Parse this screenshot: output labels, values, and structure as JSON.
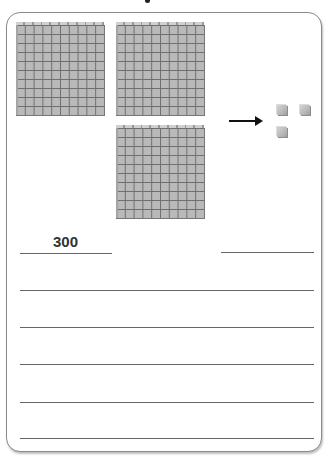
{
  "worksheet": {
    "blocks": {
      "hundreds_count": 3,
      "ones_count": 3,
      "hundreds_grid": "10x10",
      "arrow_direction": "right"
    },
    "answer": {
      "hundreds_value": "300",
      "ones_value": ""
    },
    "writing_lines": [
      "",
      "",
      "",
      "",
      ""
    ],
    "colors": {
      "block_fill": "#b9b9b9",
      "grid_line": "#6e6e6e",
      "border": "#8a8a8a",
      "text": "#333333"
    }
  }
}
